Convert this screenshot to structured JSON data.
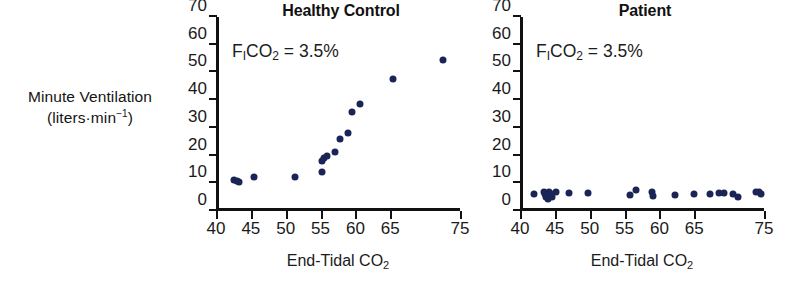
{
  "figure": {
    "axis_label_y_line1": "Minute Ventilation",
    "axis_label_y_line2_pre": "(liters·min",
    "axis_label_y_line2_sup": "−1",
    "axis_label_y_line2_post": ")",
    "marker_color": "#1a2456",
    "axis_color": "#111111",
    "background_color": "#ffffff"
  },
  "chart_data": [
    {
      "type": "scatter",
      "title": "Healthy Control",
      "xlabel": "End-Tidal CO2",
      "xlabel_base": "End-Tidal CO",
      "xlabel_sub": "2",
      "ylabel": "Minute Ventilation (liters·min−1)",
      "annotation": "FICO2 = 3.5%",
      "annotation_parts": {
        "f": "F",
        "sub_i": "I",
        "co": "CO",
        "sub_2": "2",
        "value": " = 3.5%"
      },
      "xlim": [
        40,
        75
      ],
      "ylim": [
        0,
        70
      ],
      "xticks": [
        40,
        45,
        50,
        55,
        60,
        65,
        75
      ],
      "xticklabels": [
        "40",
        "45",
        "50",
        "55",
        "60",
        "65",
        "75"
      ],
      "yticks": [
        0,
        10,
        20,
        30,
        40,
        50,
        60,
        70
      ],
      "yticklabels": [
        "0",
        "10",
        "20",
        "30",
        "40",
        "50",
        "60",
        "70"
      ],
      "grid": false,
      "legend": "none",
      "points": [
        {
          "x": 42.6,
          "y": 11.2
        },
        {
          "x": 43.0,
          "y": 11.0
        },
        {
          "x": 43.3,
          "y": 10.6
        },
        {
          "x": 45.4,
          "y": 12.2
        },
        {
          "x": 51.3,
          "y": 12.4
        },
        {
          "x": 55.2,
          "y": 14.1
        },
        {
          "x": 55.2,
          "y": 17.9
        },
        {
          "x": 55.5,
          "y": 19.1
        },
        {
          "x": 55.9,
          "y": 19.8
        },
        {
          "x": 57.0,
          "y": 21.4
        },
        {
          "x": 57.8,
          "y": 25.9
        },
        {
          "x": 58.9,
          "y": 28.2
        },
        {
          "x": 59.5,
          "y": 35.7
        },
        {
          "x": 60.6,
          "y": 38.7
        },
        {
          "x": 65.4,
          "y": 47.5
        },
        {
          "x": 72.6,
          "y": 54.6
        }
      ]
    },
    {
      "type": "scatter",
      "title": "Patient",
      "xlabel": "End-Tidal CO2",
      "xlabel_base": "End-Tidal CO",
      "xlabel_sub": "2",
      "ylabel": "Minute Ventilation (liters·min−1)",
      "annotation": "FICO2 = 3.5%",
      "annotation_parts": {
        "f": "F",
        "sub_i": "I",
        "co": "CO",
        "sub_2": "2",
        "value": " = 3.5%"
      },
      "xlim": [
        40,
        75
      ],
      "ylim": [
        0,
        70
      ],
      "xticks": [
        40,
        45,
        50,
        55,
        60,
        65,
        75
      ],
      "xticklabels": [
        "40",
        "45",
        "50",
        "55",
        "60",
        "65",
        "75"
      ],
      "yticks": [
        0,
        10,
        20,
        30,
        40,
        50,
        60,
        70
      ],
      "yticklabels": [
        "0",
        "10",
        "20",
        "30",
        "40",
        "50",
        "60",
        "70"
      ],
      "grid": false,
      "legend": "none",
      "points": [
        {
          "x": 42.0,
          "y": 6.2
        },
        {
          "x": 43.4,
          "y": 7.0
        },
        {
          "x": 43.6,
          "y": 6.1
        },
        {
          "x": 43.7,
          "y": 5.1
        },
        {
          "x": 44.0,
          "y": 4.5
        },
        {
          "x": 44.2,
          "y": 6.8
        },
        {
          "x": 44.5,
          "y": 6.0
        },
        {
          "x": 44.6,
          "y": 5.0
        },
        {
          "x": 45.2,
          "y": 6.7
        },
        {
          "x": 47.0,
          "y": 6.4
        },
        {
          "x": 49.7,
          "y": 6.6
        },
        {
          "x": 55.8,
          "y": 5.6
        },
        {
          "x": 56.7,
          "y": 7.6
        },
        {
          "x": 59.0,
          "y": 6.8
        },
        {
          "x": 59.1,
          "y": 5.3
        },
        {
          "x": 62.2,
          "y": 5.6
        },
        {
          "x": 65.0,
          "y": 6.2
        },
        {
          "x": 67.2,
          "y": 6.1
        },
        {
          "x": 68.5,
          "y": 6.5
        },
        {
          "x": 69.3,
          "y": 6.6
        },
        {
          "x": 70.6,
          "y": 6.3
        },
        {
          "x": 71.2,
          "y": 5.2
        },
        {
          "x": 73.8,
          "y": 6.7
        },
        {
          "x": 74.3,
          "y": 7.0
        },
        {
          "x": 74.5,
          "y": 6.0
        }
      ]
    }
  ]
}
